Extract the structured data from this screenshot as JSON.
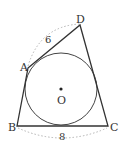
{
  "diagram": {
    "type": "geometry",
    "points": {
      "A": {
        "label": "A",
        "x": 28,
        "y": 68
      },
      "B": {
        "label": "B",
        "x": 17,
        "y": 126
      },
      "C": {
        "label": "C",
        "x": 108,
        "y": 126
      },
      "D": {
        "label": "D",
        "x": 80,
        "y": 25
      }
    },
    "center": {
      "label": "O",
      "x": 61,
      "y": 89
    },
    "circle": {
      "cx": 61,
      "cy": 89,
      "r": 36
    },
    "measurements": {
      "AD": "6",
      "BC": "8"
    },
    "colors": {
      "line": "#333333",
      "dashed": "#aaaaaa"
    }
  }
}
